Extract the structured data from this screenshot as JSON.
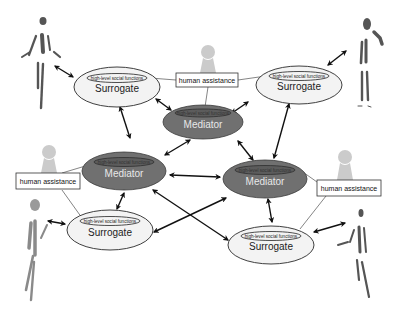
{
  "diagram": {
    "type": "network-architecture",
    "colors": {
      "surrogate_fill": "#f3f3f3",
      "surrogate_stroke": "#2a2a2a",
      "mediator_fill": "#707070",
      "mediator_stroke": "#3a3a3a",
      "mediator_text": "#ececec",
      "arrow": "#111111",
      "human_silhouette": "#c8c8c8",
      "person_figure": "#555555"
    },
    "surrogates": [
      {
        "id": "surrogate-top-left",
        "label": "Surrogate",
        "sublabel": "high-level social functions"
      },
      {
        "id": "surrogate-top-right",
        "label": "Surrogate",
        "sublabel": "high-level social functions"
      },
      {
        "id": "surrogate-bottom-left",
        "label": "Surrogate",
        "sublabel": "high-level social functions"
      },
      {
        "id": "surrogate-bottom-right",
        "label": "Surrogate",
        "sublabel": "high-level social functions"
      }
    ],
    "mediators": [
      {
        "id": "mediator-top",
        "label": "Mediator",
        "sublabel": "high-level social functions"
      },
      {
        "id": "mediator-left",
        "label": "Mediator",
        "sublabel": "high-level social functions"
      },
      {
        "id": "mediator-right",
        "label": "Mediator",
        "sublabel": "high-level social functions"
      }
    ],
    "human_assistance": [
      {
        "id": "ha-top",
        "label": "human assistance"
      },
      {
        "id": "ha-left",
        "label": "human assistance"
      },
      {
        "id": "ha-right",
        "label": "human assistance"
      }
    ],
    "people": [
      {
        "id": "person-top-left",
        "icon": "person-figure-icon"
      },
      {
        "id": "person-top-right",
        "icon": "person-figure-icon"
      },
      {
        "id": "person-bottom-left",
        "icon": "person-figure-icon"
      },
      {
        "id": "person-bottom-right",
        "icon": "person-figure-icon"
      }
    ],
    "connections": [
      {
        "from": "person-top-left",
        "to": "surrogate-top-left",
        "type": "bidirectional"
      },
      {
        "from": "person-top-right",
        "to": "surrogate-top-right",
        "type": "bidirectional"
      },
      {
        "from": "person-bottom-left",
        "to": "surrogate-bottom-left",
        "type": "bidirectional"
      },
      {
        "from": "person-bottom-right",
        "to": "surrogate-bottom-right",
        "type": "bidirectional"
      },
      {
        "from": "surrogate-top-left",
        "to": "mediator-top",
        "type": "bidirectional"
      },
      {
        "from": "surrogate-top-right",
        "to": "mediator-top",
        "type": "bidirectional"
      },
      {
        "from": "surrogate-top-left",
        "to": "mediator-left",
        "type": "bidirectional"
      },
      {
        "from": "surrogate-top-right",
        "to": "mediator-right",
        "type": "bidirectional"
      },
      {
        "from": "mediator-top",
        "to": "mediator-left",
        "type": "bidirectional"
      },
      {
        "from": "mediator-top",
        "to": "mediator-right",
        "type": "bidirectional"
      },
      {
        "from": "mediator-left",
        "to": "mediator-right",
        "type": "bidirectional"
      },
      {
        "from": "mediator-left",
        "to": "surrogate-bottom-left",
        "type": "bidirectional"
      },
      {
        "from": "mediator-right",
        "to": "surrogate-bottom-right",
        "type": "bidirectional"
      },
      {
        "from": "mediator-left",
        "to": "surrogate-bottom-right",
        "type": "bidirectional"
      },
      {
        "from": "mediator-right",
        "to": "surrogate-bottom-left",
        "type": "bidirectional"
      },
      {
        "from": "ha-top",
        "to": "surrogate-top-left",
        "type": "line"
      },
      {
        "from": "ha-top",
        "to": "surrogate-top-right",
        "type": "line"
      },
      {
        "from": "ha-top",
        "to": "mediator-top",
        "type": "line"
      },
      {
        "from": "ha-left",
        "to": "mediator-left",
        "type": "line"
      },
      {
        "from": "ha-left",
        "to": "surrogate-bottom-left",
        "type": "line"
      },
      {
        "from": "ha-right",
        "to": "mediator-right",
        "type": "line"
      },
      {
        "from": "ha-right",
        "to": "surrogate-bottom-right",
        "type": "line"
      }
    ]
  }
}
